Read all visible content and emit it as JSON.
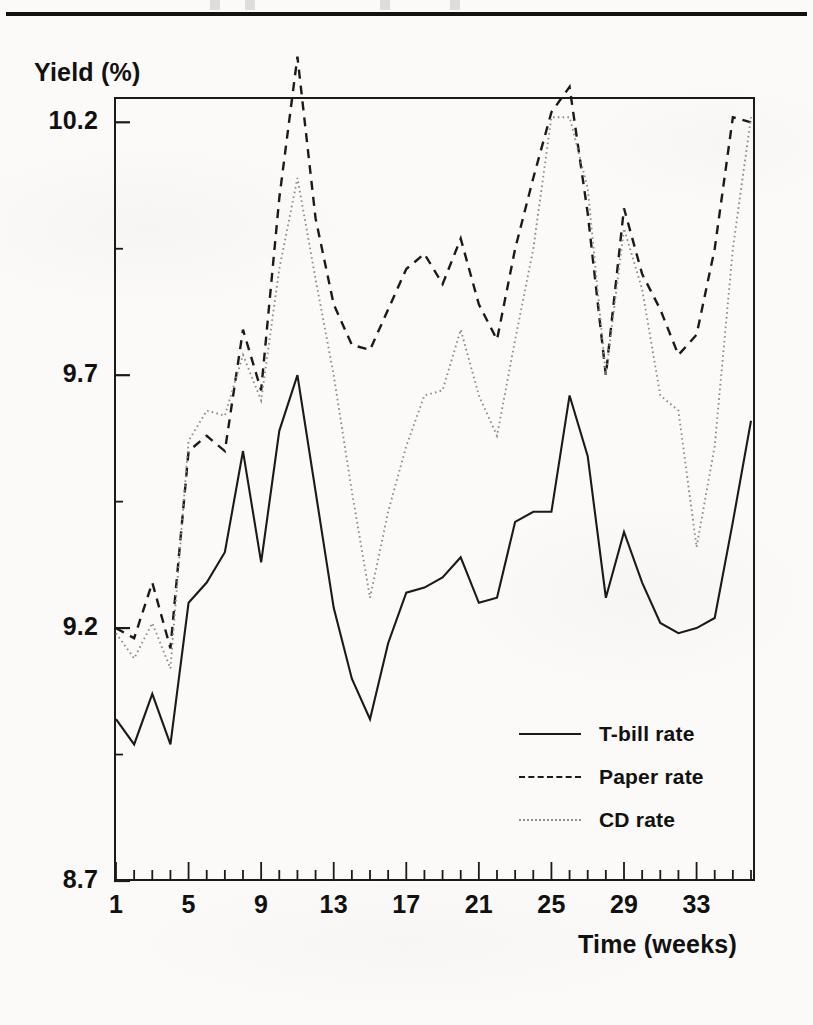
{
  "page": {
    "rule_present": true
  },
  "axes": {
    "ylabel": "Yield (%)",
    "xlabel": "Time (weeks)",
    "y_ticks": [
      "8.7",
      "9.2",
      "9.7",
      "10.2"
    ],
    "x_ticks": [
      "1",
      "5",
      "9",
      "13",
      "17",
      "21",
      "25",
      "29",
      "33"
    ]
  },
  "legend": {
    "items": [
      {
        "label": "T-bill rate",
        "style": "solid",
        "color": "#1a1a1a"
      },
      {
        "label": "Paper rate",
        "style": "dashed",
        "color": "#1a1a1a"
      },
      {
        "label": "CD rate",
        "style": "dotted",
        "color": "#8d8d8d"
      }
    ]
  },
  "chart_data": {
    "type": "line",
    "title": "",
    "xlabel": "Time (weeks)",
    "ylabel": "Yield (%)",
    "xlim": [
      1,
      36
    ],
    "ylim": [
      8.7,
      10.25
    ],
    "yticks": [
      8.7,
      9.2,
      9.7,
      10.2
    ],
    "xticks": [
      1,
      5,
      9,
      13,
      17,
      21,
      25,
      29,
      33
    ],
    "grid": false,
    "legend_position": "inside-lower-right",
    "x": [
      1,
      2,
      3,
      4,
      5,
      6,
      7,
      8,
      9,
      10,
      11,
      12,
      13,
      14,
      15,
      16,
      17,
      18,
      19,
      20,
      21,
      22,
      23,
      24,
      25,
      26,
      27,
      28,
      29,
      30,
      31,
      32,
      33,
      34,
      35,
      36
    ],
    "series": [
      {
        "name": "T-bill rate",
        "style": "solid",
        "color": "#1a1a1a",
        "values": [
          9.02,
          8.97,
          9.07,
          8.97,
          9.25,
          9.29,
          9.35,
          9.55,
          9.33,
          9.59,
          9.7,
          9.47,
          9.24,
          9.1,
          9.02,
          9.17,
          9.27,
          9.28,
          9.3,
          9.34,
          9.25,
          9.26,
          9.41,
          9.43,
          9.43,
          9.66,
          9.54,
          9.26,
          9.39,
          9.29,
          9.21,
          9.19,
          9.2,
          9.22,
          9.41,
          9.61
        ]
      },
      {
        "name": "Paper rate",
        "style": "dashed",
        "color": "#1a1a1a",
        "values": [
          9.2,
          9.18,
          9.29,
          9.16,
          9.55,
          9.58,
          9.55,
          9.79,
          9.67,
          10.05,
          10.33,
          10.01,
          9.84,
          9.76,
          9.75,
          9.83,
          9.91,
          9.94,
          9.88,
          9.97,
          9.84,
          9.77,
          9.95,
          10.09,
          10.22,
          10.27,
          10.02,
          9.7,
          10.03,
          9.9,
          9.83,
          9.74,
          9.78,
          9.95,
          10.21,
          10.2
        ]
      },
      {
        "name": "CD rate",
        "style": "dotted",
        "color": "#8d8d8d",
        "values": [
          9.19,
          9.14,
          9.21,
          9.12,
          9.57,
          9.63,
          9.62,
          9.74,
          9.65,
          9.91,
          10.09,
          9.89,
          9.7,
          9.47,
          9.26,
          9.43,
          9.56,
          9.66,
          9.67,
          9.79,
          9.66,
          9.58,
          9.77,
          9.95,
          10.21,
          10.21,
          10.07,
          9.7,
          9.99,
          9.87,
          9.66,
          9.63,
          9.36,
          9.56,
          9.95,
          10.21
        ]
      }
    ]
  }
}
